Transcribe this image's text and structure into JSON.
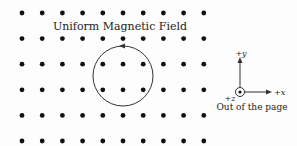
{
  "figure": {
    "title": "Uniform Magnetic Field",
    "field_direction_label": "Out of the page",
    "axes": {
      "y_label": "+y",
      "x_label": "+x",
      "z_label": "+z"
    },
    "grid": {
      "columns": 10,
      "rows": 6,
      "x_start": 22,
      "x_step": 20.2,
      "y_start": 13,
      "y_step": 25.6,
      "dot_symbol": "field-out-of-page-dot"
    },
    "loop": {
      "shape": "circle",
      "direction": "counterclockwise",
      "cx": 123,
      "cy": 76,
      "r": 30
    },
    "colors": {
      "dot": "#111111",
      "line": "#333333",
      "text": "#222222"
    }
  }
}
